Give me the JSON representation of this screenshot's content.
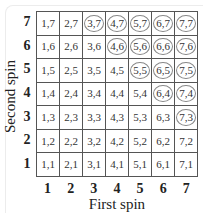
{
  "chart_data": {
    "type": "table",
    "title": "",
    "xlabel": "First spin",
    "ylabel": "Second spin",
    "x_ticks": [
      "1",
      "2",
      "3",
      "4",
      "5",
      "6",
      "7"
    ],
    "y_ticks": [
      "7",
      "6",
      "5",
      "4",
      "3",
      "2",
      "1"
    ],
    "rows": [
      [
        {
          "t": "1,7",
          "c": false
        },
        {
          "t": "2,7",
          "c": false
        },
        {
          "t": "3,7",
          "c": true
        },
        {
          "t": "4,7",
          "c": true
        },
        {
          "t": "5,7",
          "c": true
        },
        {
          "t": "6,7",
          "c": true
        },
        {
          "t": "7,7",
          "c": true
        }
      ],
      [
        {
          "t": "1,6",
          "c": false
        },
        {
          "t": "2,6",
          "c": false
        },
        {
          "t": "3,6",
          "c": false
        },
        {
          "t": "4,6",
          "c": true
        },
        {
          "t": "5,6",
          "c": true
        },
        {
          "t": "6,6",
          "c": true
        },
        {
          "t": "7,6",
          "c": true
        }
      ],
      [
        {
          "t": "1,5",
          "c": false
        },
        {
          "t": "2,5",
          "c": false
        },
        {
          "t": "3,5",
          "c": false
        },
        {
          "t": "4,5",
          "c": false
        },
        {
          "t": "5,5",
          "c": true
        },
        {
          "t": "6,5",
          "c": true
        },
        {
          "t": "7,5",
          "c": true
        }
      ],
      [
        {
          "t": "1,4",
          "c": false
        },
        {
          "t": "2,4",
          "c": false
        },
        {
          "t": "3,4",
          "c": false
        },
        {
          "t": "4,4",
          "c": false
        },
        {
          "t": "5,4",
          "c": false
        },
        {
          "t": "6,4",
          "c": true
        },
        {
          "t": "7,4",
          "c": true
        }
      ],
      [
        {
          "t": "1,3",
          "c": false
        },
        {
          "t": "2,3",
          "c": false
        },
        {
          "t": "3,3",
          "c": false
        },
        {
          "t": "4,3",
          "c": false
        },
        {
          "t": "5,3",
          "c": false
        },
        {
          "t": "6,3",
          "c": false
        },
        {
          "t": "7,3",
          "c": true
        }
      ],
      [
        {
          "t": "1,2",
          "c": false
        },
        {
          "t": "2,2",
          "c": false
        },
        {
          "t": "3,2",
          "c": false
        },
        {
          "t": "4,2",
          "c": false
        },
        {
          "t": "5,2",
          "c": false
        },
        {
          "t": "6,2",
          "c": false
        },
        {
          "t": "7,2",
          "c": false
        }
      ],
      [
        {
          "t": "1,1",
          "c": false
        },
        {
          "t": "2,1",
          "c": false
        },
        {
          "t": "3,1",
          "c": false
        },
        {
          "t": "4,1",
          "c": false
        },
        {
          "t": "5,1",
          "c": false
        },
        {
          "t": "6,1",
          "c": false
        },
        {
          "t": "7,1",
          "c": false
        }
      ]
    ],
    "circled_count": 15,
    "total_outcomes": 49
  }
}
